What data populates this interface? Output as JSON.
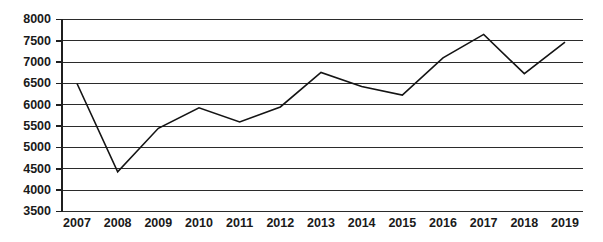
{
  "chart_data": {
    "type": "line",
    "title": "",
    "subtitle": "",
    "xlabel": "",
    "ylabel": "",
    "categories": [
      "2007",
      "2008",
      "2009",
      "2010",
      "2011",
      "2012",
      "2013",
      "2014",
      "2015",
      "2016",
      "2017",
      "2018",
      "2019"
    ],
    "values": [
      6500,
      4430,
      5450,
      5930,
      5600,
      5950,
      6760,
      6430,
      6230,
      7100,
      7650,
      6730,
      7470
    ],
    "series": [
      {
        "name": "",
        "values": [
          6500,
          4430,
          5450,
          5930,
          5600,
          5950,
          6760,
          6430,
          6230,
          7100,
          7650,
          6730,
          7470
        ]
      }
    ],
    "ylim": [
      3500,
      8000
    ],
    "ytick_values": [
      3500,
      4000,
      4500,
      5000,
      5500,
      6000,
      6500,
      7000,
      7500,
      8000
    ],
    "ytick_labels": [
      "3500",
      "4000",
      "4500",
      "5000",
      "5500",
      "6000",
      "6500",
      "7000",
      "7500",
      "8000"
    ],
    "xtick_labels": [
      "2007",
      "2008",
      "2009",
      "2010",
      "2011",
      "2012",
      "2013",
      "2014",
      "2015",
      "2016",
      "2017",
      "2018",
      "2019"
    ],
    "grid": "horizontal",
    "legend": "none",
    "line_color": "#141414",
    "grid_color": "#2b2b2b",
    "axis_color": "#1f1f1f",
    "background_color": "#ffffff"
  }
}
